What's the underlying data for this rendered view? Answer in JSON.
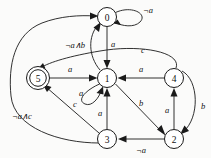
{
  "diagram": {
    "type": "finite-state-automaton",
    "title": "",
    "background_color": "#fbfbfa",
    "stroke_color": "#1a1a1a",
    "nodes": [
      {
        "id": "0",
        "label": "0",
        "cx": 107,
        "cy": 17,
        "r": 9.5,
        "accepting": false
      },
      {
        "id": "1",
        "label": "1",
        "cx": 107,
        "cy": 78,
        "r": 9.5,
        "accepting": false
      },
      {
        "id": "4",
        "label": "4",
        "cx": 174,
        "cy": 78,
        "r": 9.5,
        "accepting": false
      },
      {
        "id": "5",
        "label": "5",
        "cx": 38,
        "cy": 78,
        "r": 9.5,
        "accepting": true
      },
      {
        "id": "3",
        "label": "3",
        "cx": 107,
        "cy": 139,
        "r": 9.5,
        "accepting": false
      },
      {
        "id": "2",
        "label": "2",
        "cx": 174,
        "cy": 139,
        "r": 9.5,
        "accepting": false
      }
    ],
    "edges": [
      {
        "id": "e0-self",
        "from": "0",
        "to": "0",
        "label": "¬a",
        "label_x": 148,
        "label_y": 10
      },
      {
        "id": "e0-1",
        "from": "0",
        "to": "1",
        "label": "a",
        "label_x": 113,
        "label_y": 44
      },
      {
        "id": "e5-1",
        "from": "5",
        "to": "1",
        "label": "a",
        "label_x": 70,
        "label_y": 69
      },
      {
        "id": "e4-1",
        "from": "4",
        "to": "1",
        "label": "a",
        "label_x": 141,
        "label_y": 69
      },
      {
        "id": "e1-self",
        "from": "1",
        "to": "1",
        "label": "a",
        "label_x": 81,
        "label_y": 93
      },
      {
        "id": "e3-1",
        "from": "3",
        "to": "1",
        "label": "a",
        "label_x": 100,
        "label_y": 113
      },
      {
        "id": "e1-2",
        "from": "1",
        "to": "2",
        "label": "b",
        "label_x": 141,
        "label_y": 103
      },
      {
        "id": "e2-4",
        "from": "2",
        "to": "4",
        "label": "a",
        "label_x": 167,
        "label_y": 110
      },
      {
        "id": "e4-2",
        "from": "4",
        "to": "2",
        "label": "b",
        "label_x": 203,
        "label_y": 106
      },
      {
        "id": "e2-3",
        "from": "2",
        "to": "3",
        "label": "¬a",
        "label_x": 141,
        "label_y": 150
      },
      {
        "id": "e3-5",
        "from": "3",
        "to": "5",
        "label": "c",
        "label_x": 75,
        "label_y": 104
      },
      {
        "id": "e1-0",
        "from": "1",
        "to": "0",
        "label": "¬a∧b",
        "label_x": 75,
        "label_y": 45
      },
      {
        "id": "e4-5",
        "from": "4",
        "to": "5",
        "label": "c",
        "label_x": 143,
        "label_y": 50
      },
      {
        "id": "e3-0",
        "from": "3",
        "to": "0",
        "label": "¬a∧c",
        "label_x": 22,
        "label_y": 116
      }
    ]
  }
}
